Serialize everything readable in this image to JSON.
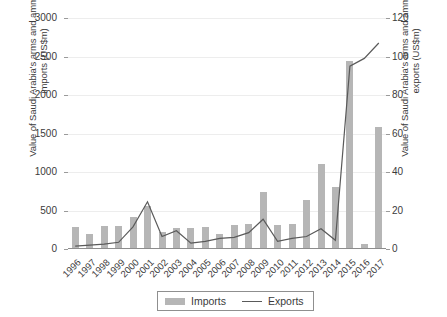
{
  "chart_data": {
    "type": "bar",
    "title": "",
    "subtitle": "",
    "xlabel": "",
    "ylabel": "Value of Saudi Arabia's arms and ammunitions imports (US$m)",
    "ylabel_right": "Value of Saudi Arabia's arms and ammunitions exports (US$m)",
    "categories": [
      "1996",
      "1997",
      "1998",
      "1999",
      "2000",
      "2001",
      "2002",
      "2003",
      "2004",
      "2005",
      "2006",
      "2007",
      "2008",
      "2009",
      "2010",
      "2011",
      "2012",
      "2013",
      "2014",
      "2015",
      "2016",
      "2017"
    ],
    "ylim": [
      0,
      3000
    ],
    "yticks": [
      0,
      500,
      1000,
      1500,
      2000,
      2500,
      3000
    ],
    "ylim_right": [
      0,
      120
    ],
    "yticks_right": [
      0,
      20,
      40,
      60,
      80,
      100,
      120
    ],
    "grid": true,
    "legend_position": "bottom-center",
    "series": [
      {
        "name": "Imports",
        "type": "bar",
        "axis": "left",
        "color": "#b6b6b6",
        "values": [
          290,
          195,
          300,
          305,
          420,
          560,
          215,
          275,
          270,
          285,
          190,
          310,
          330,
          745,
          310,
          330,
          640,
          1100,
          810,
          2440,
          60,
          1580
        ]
      },
      {
        "name": "Exports",
        "type": "line",
        "axis": "right",
        "color": "#5a5a5a",
        "values": [
          1.5,
          2.0,
          2.5,
          3.5,
          11.5,
          24.5,
          6.5,
          9.5,
          3.0,
          4.0,
          5.5,
          6.0,
          8.5,
          15.5,
          4.0,
          5.5,
          6.5,
          10.5,
          4.5,
          95.0,
          99.0,
          107.0
        ]
      }
    ]
  },
  "legend": {
    "imports_label": "Imports",
    "exports_label": "Exports"
  },
  "colors": {
    "bar": "#b6b6b6",
    "line": "#5a5a5a",
    "grid": "#ededed",
    "axis": "#8d8d8d",
    "text": "#3b3b3b"
  }
}
